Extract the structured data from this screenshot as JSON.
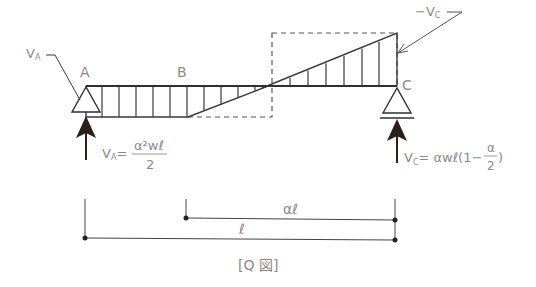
{
  "diagram": {
    "caption": "[Q 図]",
    "points": {
      "A": "A",
      "B": "B",
      "C": "C"
    },
    "labels": {
      "va_pointer": "V",
      "va_pointer_sub": "A",
      "neg_vc": "−V",
      "neg_vc_sub": "C",
      "va_eq_lhs": "V",
      "va_eq_lhs_sub": "A",
      "va_eq_equals": "=",
      "va_eq_num": "α²wℓ",
      "va_eq_den": "2",
      "vc_eq_lhs": "V",
      "vc_eq_lhs_sub": "C",
      "vc_eq_rhs_a": "= αwℓ(1−",
      "vc_eq_frac_num": "α",
      "vc_eq_frac_den": "2",
      "vc_eq_rhs_b": ")"
    },
    "dimensions": {
      "al": "αℓ",
      "l": "ℓ"
    },
    "colors": {
      "line": "#3a3a3a",
      "text": "#8a8a8a",
      "arrow": "#2a1f1c"
    }
  }
}
